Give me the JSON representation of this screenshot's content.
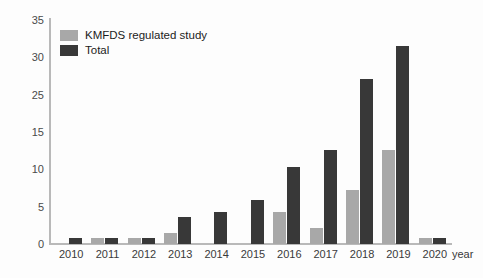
{
  "chart_data": {
    "type": "bar",
    "title": "",
    "xlabel": "year",
    "ylabel": "",
    "categories": [
      "2010",
      "2011",
      "2012",
      "2013",
      "2014",
      "2015",
      "2016",
      "2017",
      "2018",
      "2019",
      "2020"
    ],
    "series": [
      {
        "name": "KMFDS regulated study",
        "color": "#a8a8a8",
        "values": [
          0,
          1,
          1,
          1.7,
          0,
          0,
          5,
          2.5,
          8.3,
          14.5,
          1
        ]
      },
      {
        "name": "Total",
        "color": "#383838",
        "values": [
          1,
          1,
          1,
          4.2,
          5,
          6.8,
          12,
          14.5,
          25.5,
          30.6,
          1
        ]
      }
    ],
    "ylim": [
      0,
      35
    ],
    "ytick_labels": [
      "35",
      "30",
      "25",
      "15",
      "10",
      "5",
      "0"
    ],
    "ytick_values": [
      35,
      30,
      25,
      15,
      10,
      5,
      0
    ],
    "grid": false,
    "legend_position": "top-left"
  },
  "axis": {
    "x_title": "year"
  },
  "legend": {
    "entries": [
      {
        "label": "KMFDS regulated study",
        "color": "#a8a8a8"
      },
      {
        "label": "Total",
        "color": "#383838"
      }
    ]
  }
}
